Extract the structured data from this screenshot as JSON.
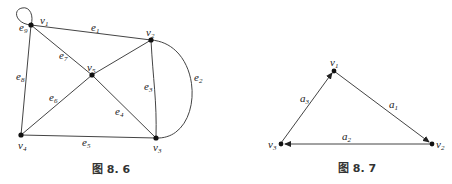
{
  "figure_8_6": {
    "caption": "图 8. 6",
    "vertices": [
      {
        "id": "v1",
        "name": "v",
        "sub": "1"
      },
      {
        "id": "v2",
        "name": "v",
        "sub": "2"
      },
      {
        "id": "v3",
        "name": "v",
        "sub": "3"
      },
      {
        "id": "v4",
        "name": "v",
        "sub": "4"
      },
      {
        "id": "v5",
        "name": "v",
        "sub": "5"
      }
    ],
    "edges": [
      {
        "id": "e1",
        "name": "e",
        "sub": "1",
        "from": "v1",
        "to": "v2"
      },
      {
        "id": "e2",
        "name": "e",
        "sub": "2",
        "from": "v2",
        "to": "v3",
        "curved": true
      },
      {
        "id": "e3",
        "name": "e",
        "sub": "3",
        "from": "v2",
        "to": "v3"
      },
      {
        "id": "e4",
        "name": "e",
        "sub": "4",
        "from": "v5",
        "to": "v3"
      },
      {
        "id": "e5",
        "name": "e",
        "sub": "5",
        "from": "v4",
        "to": "v3"
      },
      {
        "id": "e6",
        "name": "e",
        "sub": "6",
        "from": "v4",
        "to": "v5"
      },
      {
        "id": "e7",
        "name": "e",
        "sub": "7",
        "from": "v1",
        "to": "v5"
      },
      {
        "id": "e8",
        "name": "e",
        "sub": "8",
        "from": "v1",
        "to": "v4"
      },
      {
        "id": "e9",
        "name": "e",
        "sub": "9",
        "from": "v1",
        "to": "v1",
        "loop": true
      }
    ]
  },
  "figure_8_7": {
    "caption": "图 8. 7",
    "vertices": [
      {
        "id": "v1",
        "name": "v",
        "sub": "1"
      },
      {
        "id": "v2",
        "name": "v",
        "sub": "2"
      },
      {
        "id": "v3",
        "name": "v",
        "sub": "3"
      }
    ],
    "arcs": [
      {
        "id": "a1",
        "name": "a",
        "sub": "1",
        "from": "v1",
        "to": "v2"
      },
      {
        "id": "a2",
        "name": "a",
        "sub": "2",
        "from": "v2",
        "to": "v3"
      },
      {
        "id": "a3",
        "name": "a",
        "sub": "3",
        "from": "v3",
        "to": "v1"
      }
    ]
  },
  "colors": {
    "edge": "#444444",
    "node": "#111111",
    "background": "#ffffff"
  }
}
